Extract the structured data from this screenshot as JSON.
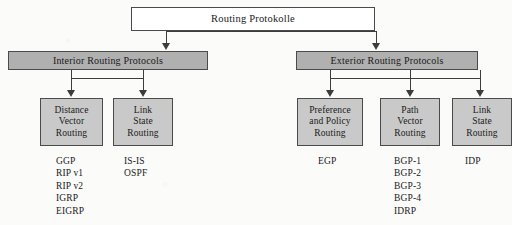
{
  "diagram": {
    "title": "Routing Protokolle",
    "type": "hierarchy-tree",
    "root": {
      "label": "Routing Protokolle"
    },
    "groups": [
      {
        "id": "interior",
        "label": "Interior Routing Protocols"
      },
      {
        "id": "exterior",
        "label": "Exterior Routing Protocols"
      }
    ],
    "leaves": [
      {
        "id": "distance-vector-routing",
        "lines": [
          "Distance",
          "Vector",
          "Routing"
        ],
        "protocols": [
          "GGP",
          "RIP v1",
          "RIP v2",
          "IGRP",
          "EIGRP"
        ]
      },
      {
        "id": "link-state-routing-interior",
        "lines": [
          "Link",
          "State",
          "Routing"
        ],
        "protocols": [
          "IS-IS",
          "OSPF"
        ]
      },
      {
        "id": "preference-and-policy-routing",
        "lines": [
          "Preference",
          "and Policy",
          "Routing"
        ],
        "protocols": [
          "EGP"
        ]
      },
      {
        "id": "path-vector-routing",
        "lines": [
          "Path",
          "Vector",
          "Routing"
        ],
        "protocols": [
          "BGP-1",
          "BGP-2",
          "BGP-3",
          "BGP-4",
          "IDRP"
        ]
      },
      {
        "id": "link-state-routing-exterior",
        "lines": [
          "Link",
          "State",
          "Routing"
        ],
        "protocols": [
          "IDP"
        ]
      }
    ],
    "colors": {
      "background": "#fbfbfa",
      "root_fill": "#ffffff",
      "group_fill": "#b0b0b0",
      "leaf_fill": "#c9c9c9",
      "border": "#4a4a4a",
      "connector": "#3c3c3c",
      "text": "#1a1a1a"
    }
  }
}
